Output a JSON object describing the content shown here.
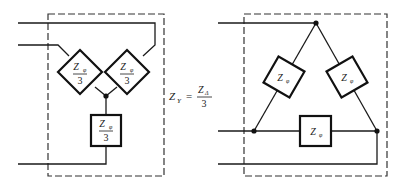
{
  "diagram": {
    "wye": {
      "impedances": [
        {
          "symbol": "Z",
          "subscript": "φ",
          "denominator": "3"
        },
        {
          "symbol": "Z",
          "subscript": "φ",
          "denominator": "3"
        },
        {
          "symbol": "Z",
          "subscript": "φ",
          "denominator": "3"
        }
      ]
    },
    "formula": {
      "lhs": "Z",
      "lhs_sub": "Y",
      "equals": "=",
      "numerator": "Z",
      "numerator_sub": "Δ",
      "denominator": "3"
    },
    "delta": {
      "impedances": [
        {
          "symbol": "Z",
          "subscript": "φ"
        },
        {
          "symbol": "Z",
          "subscript": "φ"
        },
        {
          "symbol": "Z",
          "subscript": "φ"
        }
      ]
    },
    "colors": {
      "line": "#1a1a1a",
      "frame": "#333333",
      "background": "#ffffff"
    }
  }
}
